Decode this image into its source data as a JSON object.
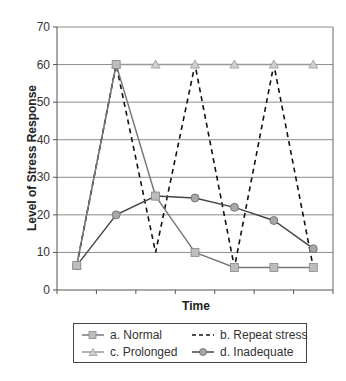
{
  "chart_data": {
    "type": "line",
    "title": "",
    "xlabel": "Time",
    "ylabel": "Level of Stress Response",
    "ylim": [
      0,
      70
    ],
    "yticks": [
      0,
      10,
      20,
      30,
      40,
      50,
      60,
      70
    ],
    "grid": "horizontal",
    "legend_position": "bottom",
    "categories": [
      "t1",
      "t2",
      "t3",
      "t4",
      "t5",
      "t6",
      "t7"
    ],
    "series": [
      {
        "name": "a. Normal",
        "style": "solid",
        "marker": "square",
        "color": "#777777",
        "marker_fill": "#bdbdbd",
        "values": [
          6.5,
          60,
          25,
          10,
          6,
          6,
          6
        ]
      },
      {
        "name": "b. Repeat stress",
        "style": "dashed",
        "marker": "none",
        "color": "#111111",
        "values": [
          6.5,
          60,
          10,
          60,
          6,
          60,
          6
        ]
      },
      {
        "name": "c. Prolonged",
        "style": "solid",
        "marker": "triangle",
        "color": "#9a9a9a",
        "marker_fill": "#d0d0d0",
        "values": [
          6.5,
          60,
          60,
          60,
          60,
          60,
          60
        ]
      },
      {
        "name": "d. Inadequate",
        "style": "solid",
        "marker": "circle",
        "color": "#444444",
        "marker_fill": "#a8a8a8",
        "values": [
          6.5,
          20,
          25,
          24.5,
          22,
          18.5,
          11
        ]
      }
    ]
  },
  "legend": {
    "items": [
      {
        "label": "a. Normal"
      },
      {
        "label": "b. Repeat stress"
      },
      {
        "label": "c. Prolonged"
      },
      {
        "label": "d. Inadequate"
      }
    ]
  }
}
